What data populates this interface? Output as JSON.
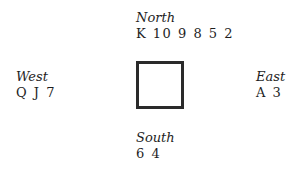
{
  "diagram": {
    "type": "bridge-hand-layout",
    "hands": {
      "north": {
        "seat": "North",
        "cards": "K 10 9 8 5 2"
      },
      "west": {
        "seat": "West",
        "cards": "Q J 7"
      },
      "east": {
        "seat": "East",
        "cards": "A 3"
      },
      "south": {
        "seat": "South",
        "cards": "6 4"
      }
    },
    "center": {
      "shape": "square-table",
      "border_color": "#2a2a2a"
    }
  }
}
